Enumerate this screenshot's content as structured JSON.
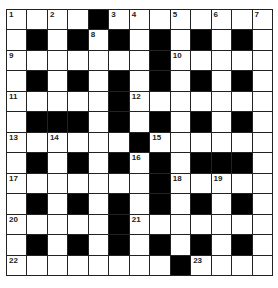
{
  "puzzle": {
    "rows": 13,
    "cols": 13,
    "grid": [
      [
        "1",
        "",
        "2",
        "",
        "#",
        "3",
        "4",
        "",
        "5",
        "",
        "6",
        "",
        "7"
      ],
      [
        "",
        "#",
        "",
        "#",
        "8",
        "#",
        "",
        "#",
        "",
        "#",
        "",
        "#",
        ""
      ],
      [
        "9",
        "",
        "",
        "",
        "",
        "",
        "",
        "#",
        "10",
        "",
        "",
        "",
        ""
      ],
      [
        "",
        "#",
        "",
        "#",
        "",
        "#",
        "",
        "#",
        "",
        "#",
        "",
        "#",
        ""
      ],
      [
        "11",
        "",
        "",
        "",
        "",
        "#",
        "12",
        "",
        "",
        "",
        "",
        "",
        ""
      ],
      [
        "",
        "#",
        "#",
        "#",
        "",
        "#",
        "",
        "#",
        "",
        "#",
        "",
        "#",
        ""
      ],
      [
        "13",
        "",
        "14",
        "",
        "",
        "",
        "#",
        "15",
        "",
        "",
        "",
        "",
        ""
      ],
      [
        "",
        "#",
        "",
        "#",
        "",
        "#",
        "16",
        "#",
        "",
        "#",
        "#",
        "#",
        ""
      ],
      [
        "17",
        "",
        "",
        "",
        "",
        "",
        "",
        "#",
        "18",
        "",
        "19",
        "",
        ""
      ],
      [
        "",
        "#",
        "",
        "#",
        "",
        "#",
        "",
        "#",
        "",
        "#",
        "",
        "#",
        ""
      ],
      [
        "20",
        "",
        "",
        "",
        "",
        "#",
        "21",
        "",
        "",
        "",
        "",
        "",
        ""
      ],
      [
        "",
        "#",
        "",
        "#",
        "",
        "#",
        "",
        "#",
        "",
        "#",
        "",
        "#",
        ""
      ],
      [
        "22",
        "",
        "",
        "",
        "",
        "",
        "",
        "",
        "#",
        "23",
        "",
        "",
        ""
      ]
    ]
  }
}
